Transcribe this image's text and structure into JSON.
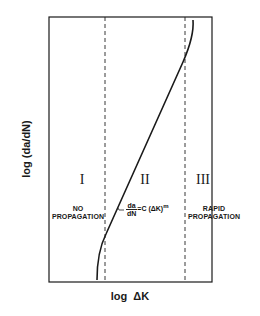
{
  "diagram": {
    "type": "fatigue-crack-growth-curve",
    "axes": {
      "x_label": "log  ΔK",
      "y_label": "log (da/dN)"
    },
    "regions": [
      {
        "numeral": "I",
        "label_line1": "NO",
        "label_line2": "PROPAGATION"
      },
      {
        "numeral": "II",
        "equation": {
          "numerator": "da",
          "denominator": "dN",
          "rhs": "=C (ΔK)",
          "exponent": "m"
        }
      },
      {
        "numeral": "III",
        "label_line1": "RAPID",
        "label_line2": "PROPAGATION"
      }
    ],
    "colors": {
      "line": "#1a1a1a",
      "background": "#ffffff"
    }
  }
}
